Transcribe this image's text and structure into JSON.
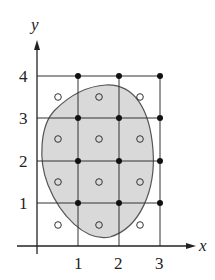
{
  "diagram": {
    "type": "grid-partition-over-region",
    "axes": {
      "x_label": "x",
      "y_label": "y",
      "x_ticks": [
        {
          "value": 1,
          "label": "1"
        },
        {
          "value": 2,
          "label": "2"
        },
        {
          "value": 3,
          "label": "3"
        }
      ],
      "y_ticks": [
        {
          "value": 1,
          "label": "1"
        },
        {
          "value": 2,
          "label": "2"
        },
        {
          "value": 3,
          "label": "3"
        },
        {
          "value": 4,
          "label": "4"
        }
      ]
    },
    "grid": {
      "x_lines": [
        1,
        2,
        3
      ],
      "y_lines": [
        1,
        2,
        3,
        4
      ],
      "x_range": [
        0,
        3
      ],
      "y_range": [
        0,
        4
      ]
    },
    "region": {
      "description": "shaded egg-shaped region",
      "fill_color": "#d9d9d9",
      "stroke_color": "#555555"
    },
    "filled_points": [
      [
        1,
        4
      ],
      [
        2,
        4
      ],
      [
        3,
        4
      ],
      [
        1,
        3
      ],
      [
        2,
        3
      ],
      [
        3,
        3
      ],
      [
        1,
        2
      ],
      [
        2,
        2
      ],
      [
        3,
        2
      ],
      [
        1,
        1
      ],
      [
        2,
        1
      ],
      [
        3,
        1
      ]
    ],
    "open_points": [
      [
        0.5,
        3.5
      ],
      [
        1.5,
        3.5
      ],
      [
        2.5,
        3.5
      ],
      [
        0.5,
        2.5
      ],
      [
        1.5,
        2.5
      ],
      [
        2.5,
        2.5
      ],
      [
        0.5,
        1.5
      ],
      [
        1.5,
        1.5
      ],
      [
        2.5,
        1.5
      ],
      [
        0.5,
        0.5
      ],
      [
        1.5,
        0.5
      ],
      [
        2.5,
        0.5
      ]
    ],
    "colors": {
      "line": "#333333",
      "point": "#111111",
      "region_fill": "#d9d9d9"
    }
  }
}
